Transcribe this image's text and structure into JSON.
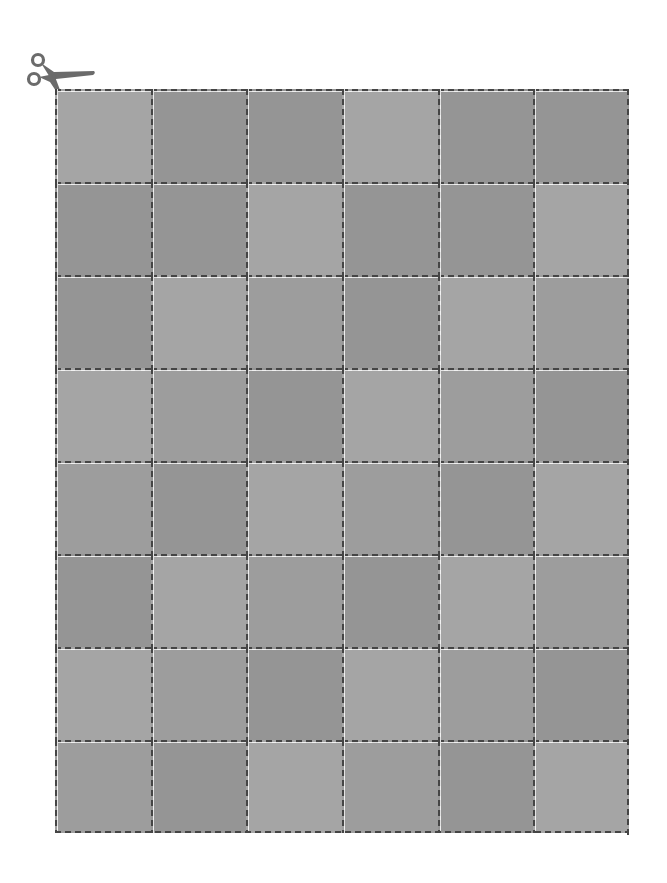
{
  "page": {
    "kind": "printable cut-out grid"
  },
  "icons": {
    "scissors": {
      "name": "scissors-icon",
      "color": "#6b6b6b"
    }
  },
  "grid": {
    "columns": 6,
    "rows": 8,
    "line_color": "#454545",
    "shades": {
      "L": "#a5a5a5",
      "M": "#9d9d9d",
      "D": "#959595"
    },
    "cells": [
      [
        "L",
        "D",
        "D",
        "L",
        "D",
        "D"
      ],
      [
        "D",
        "D",
        "L",
        "D",
        "D",
        "L"
      ],
      [
        "D",
        "L",
        "M",
        "D",
        "L",
        "M"
      ],
      [
        "L",
        "M",
        "D",
        "L",
        "M",
        "D"
      ],
      [
        "M",
        "D",
        "L",
        "M",
        "D",
        "L"
      ],
      [
        "D",
        "L",
        "M",
        "D",
        "L",
        "M"
      ],
      [
        "L",
        "M",
        "D",
        "L",
        "M",
        "D"
      ],
      [
        "M",
        "D",
        "L",
        "M",
        "D",
        "L"
      ]
    ]
  }
}
